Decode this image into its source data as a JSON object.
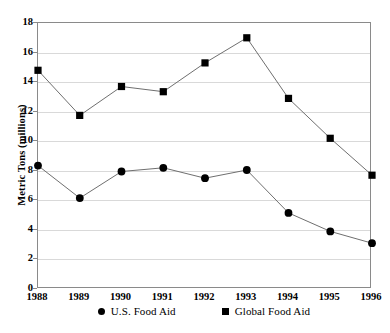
{
  "chart_data": {
    "type": "line",
    "title": "",
    "xlabel": "",
    "ylabel": "Metric Tons (millions)",
    "x": [
      1988,
      1989,
      1990,
      1991,
      1992,
      1993,
      1994,
      1995,
      1996
    ],
    "categories": [
      "1988",
      "1989",
      "1990",
      "1991",
      "1992",
      "1993",
      "1994",
      "1995",
      "1996"
    ],
    "series": [
      {
        "name": "U.S. Food Aid",
        "marker": "circle",
        "color": "#000000",
        "values": [
          8.35,
          6.15,
          7.95,
          8.2,
          7.5,
          8.05,
          5.15,
          3.9,
          3.1
        ]
      },
      {
        "name": "Global Food Aid",
        "marker": "square",
        "color": "#000000",
        "values": [
          14.8,
          11.75,
          13.7,
          13.35,
          15.3,
          17.0,
          12.9,
          10.2,
          7.7
        ]
      }
    ],
    "ylim": [
      0,
      18
    ],
    "yticks": [
      0,
      2,
      4,
      6,
      8,
      10,
      12,
      14,
      16,
      18
    ],
    "ytick_labels": [
      "0",
      "2",
      "4",
      "6",
      "8",
      "10",
      "12",
      "14",
      "16",
      "18"
    ],
    "xlim": [
      1988,
      1996
    ],
    "grid": "horizontal",
    "legend_position": "bottom-center",
    "line_color": "#6f6f6f",
    "axis_color": "#8a8a8a",
    "gridline_color": "#d9d9d9"
  },
  "legend": {
    "entries": [
      {
        "label": "U.S. Food Aid",
        "marker": "circle"
      },
      {
        "label": "Global Food Aid",
        "marker": "square"
      }
    ]
  },
  "caption": {
    "cutoff_text": ""
  }
}
